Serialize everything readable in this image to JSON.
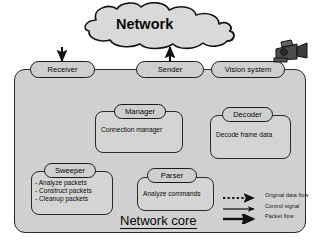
{
  "diagram": {
    "cloud": {
      "label": "Network"
    },
    "core": {
      "label": "Network core"
    },
    "top_nodes": [
      {
        "id": "receiver",
        "label": "Receiver"
      },
      {
        "id": "sender",
        "label": "Sender"
      },
      {
        "id": "vision",
        "label": "Vision system"
      }
    ],
    "components": [
      {
        "id": "manager",
        "label": "Manager",
        "body": "Connection manager"
      },
      {
        "id": "decoder",
        "label": "Decoder",
        "body": "Decode frame data"
      },
      {
        "id": "sweeper",
        "label": "Sweeper",
        "body": "- Analyze packets\n- Construct packets\n- Cleanup packets"
      },
      {
        "id": "parser",
        "label": "Parser",
        "body": "Analyze commands"
      }
    ],
    "icons": {
      "camera": "video-camera-icon"
    },
    "legend": {
      "items": [
        {
          "id": "original-data-flow",
          "label": "Original data flow",
          "style": "dotted"
        },
        {
          "id": "control-signal",
          "label": "Control signal",
          "style": "thin-solid"
        },
        {
          "id": "packet-flow",
          "label": "Packet flow",
          "style": "thick-solid"
        }
      ]
    },
    "colors": {
      "node_fill": "#d2d2d2",
      "core_fill": "#d0d0d0",
      "stroke": "#1a1a1a",
      "text": "#0a0a0a",
      "page_background": "#ffffff"
    }
  }
}
